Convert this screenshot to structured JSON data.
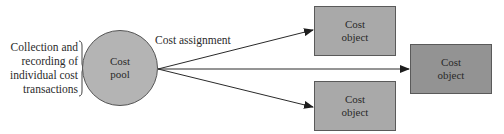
{
  "diagram": {
    "source_label": {
      "lines": [
        "Collection and",
        "recording of",
        "individual cost",
        "transactions"
      ]
    },
    "pool": {
      "lines": [
        "Cost",
        "pool"
      ],
      "fill": "#b4b4b4"
    },
    "edge_label": "Cost assignment",
    "objects": [
      {
        "lines": [
          "Cost",
          "object"
        ],
        "fill": "#a9a9a9"
      },
      {
        "lines": [
          "Cost",
          "object"
        ],
        "fill": "#939393"
      },
      {
        "lines": [
          "Cost",
          "object"
        ],
        "fill": "#a9a9a9"
      }
    ],
    "colors": {
      "line": "#2a2a2a",
      "border": "#5a5a5a"
    }
  }
}
